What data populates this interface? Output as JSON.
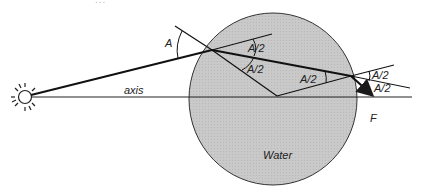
{
  "caption": {
    "text": "...",
    "note": "cut-off caption text at top edge"
  },
  "diagram": {
    "labels": {
      "angle_incidence": "A",
      "half_angle_1": "A/2",
      "half_angle_2": "A/2",
      "half_angle_3": "A/2",
      "half_angle_exit_1": "A/2",
      "half_angle_exit_2": "A/2",
      "axis": "axis",
      "focus": "F",
      "medium": "Water"
    },
    "colors": {
      "droplet_fill": "#c8c8c8",
      "line": "#1a1a1a",
      "background": "#ffffff"
    },
    "icons": {
      "light_source": "sun-icon"
    }
  }
}
